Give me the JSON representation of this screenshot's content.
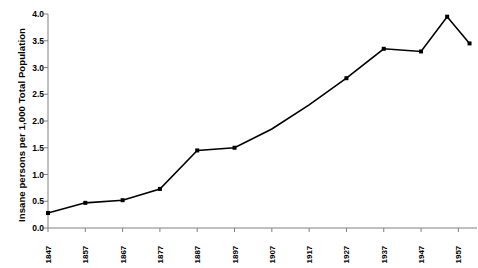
{
  "chart_data": {
    "type": "line",
    "title": "",
    "xlabel": "",
    "ylabel": "Insane persons per 1,000 Total Population",
    "x": [
      1847,
      1857,
      1867,
      1877,
      1887,
      1897,
      1907,
      1917,
      1927,
      1937,
      1947,
      1954,
      1960
    ],
    "values": [
      0.28,
      0.47,
      0.52,
      0.73,
      1.45,
      1.5,
      1.85,
      2.3,
      2.8,
      3.35,
      3.3,
      3.95,
      3.45
    ],
    "markers": [
      true,
      true,
      true,
      true,
      true,
      true,
      false,
      false,
      true,
      true,
      true,
      true,
      true
    ],
    "xlim": [
      1847,
      1962
    ],
    "ylim": [
      0.0,
      4.0
    ],
    "xticks": [
      "1847",
      "1857",
      "1867",
      "1877",
      "1887",
      "1897",
      "1907",
      "1917",
      "1927",
      "1937",
      "1947",
      "1957"
    ],
    "xtick_values": [
      1847,
      1857,
      1867,
      1877,
      1887,
      1897,
      1907,
      1917,
      1927,
      1937,
      1947,
      1957
    ],
    "yticks": [
      "0.0",
      "0.5",
      "1.0",
      "1.5",
      "2.0",
      "2.5",
      "3.0",
      "3.5",
      "4.0"
    ],
    "ytick_values": [
      0.0,
      0.5,
      1.0,
      1.5,
      2.0,
      2.5,
      3.0,
      3.5,
      4.0
    ],
    "grid": false,
    "legend": null,
    "series_color": "#000000",
    "axis_color": "#808080",
    "background": "#ffffff"
  }
}
